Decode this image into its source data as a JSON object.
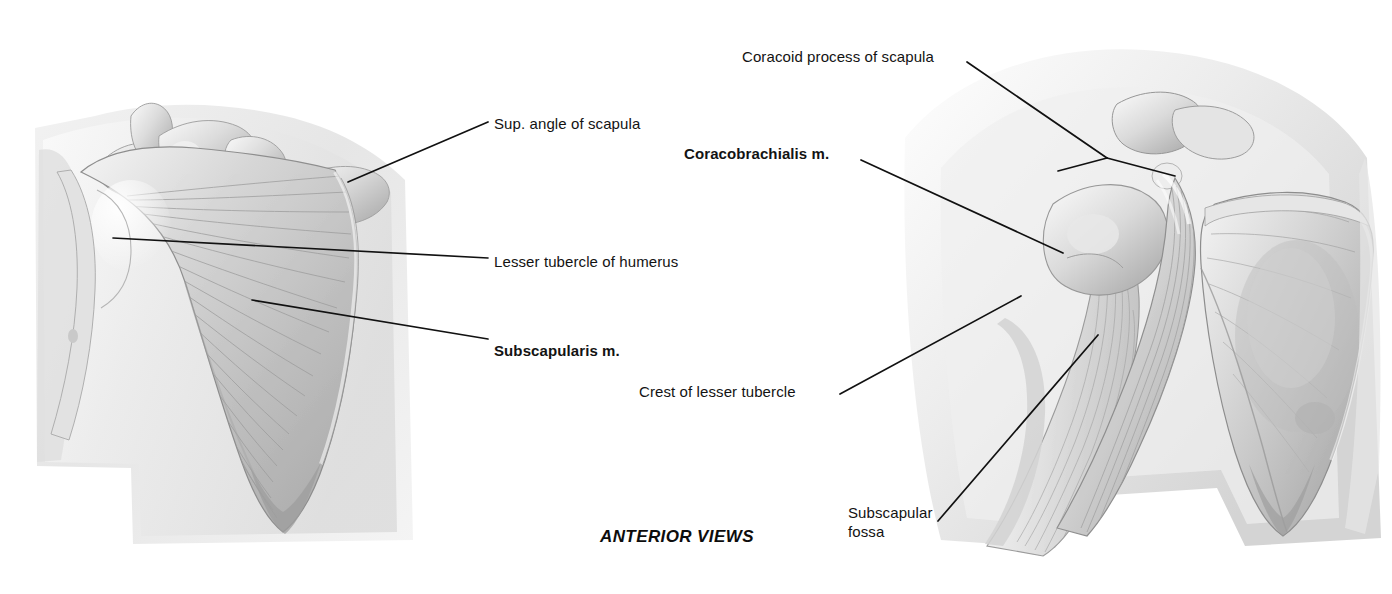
{
  "figure": {
    "caption": "ANTERIOR VIEWS",
    "background_color": "#ffffff",
    "ink_color": "#131313",
    "style": "grayscale pencil anatomical illustration"
  },
  "panels": [
    {
      "id": "left-panel",
      "name": "anterior-scapula-subscapularis",
      "description": "Anterior view of scapula with subscapularis muscle"
    },
    {
      "id": "right-panel",
      "name": "anterior-shoulder-coracobrachialis",
      "description": "Anterior view of shoulder with coracobrachialis muscle and scapula"
    }
  ],
  "labels": [
    {
      "id": "sup-angle-of-scapula",
      "text": "Sup. angle of scapula",
      "bold": false,
      "x": 494,
      "y": 114,
      "lines": [
        {
          "x1": 488,
          "y1": 122,
          "x2": 348,
          "y2": 182
        }
      ]
    },
    {
      "id": "lesser-tubercle-of-humerus",
      "text": "Lesser tubercle of humerus",
      "bold": false,
      "x": 494,
      "y": 252,
      "lines": [
        {
          "x1": 488,
          "y1": 258,
          "x2": 113,
          "y2": 238
        }
      ]
    },
    {
      "id": "subscapularis-m",
      "text": "Subscapularis m.",
      "bold": true,
      "x": 494,
      "y": 341,
      "lines": [
        {
          "x1": 488,
          "y1": 339,
          "x2": 252,
          "y2": 300
        }
      ]
    },
    {
      "id": "coracoid-process-of-scapula",
      "text": "Coracoid process of scapula",
      "bold": false,
      "x": 742,
      "y": 55,
      "lines": [
        {
          "x1": 967,
          "y1": 62,
          "x2": 1107,
          "y2": 158
        },
        {
          "x1": 1107,
          "y1": 158,
          "x2": 1060,
          "y2": 170
        },
        {
          "x1": 1107,
          "y1": 158,
          "x2": 1173,
          "y2": 175
        }
      ]
    },
    {
      "id": "coracobrachialis-m",
      "text": "Coracobrachialis m.",
      "bold": true,
      "x": 684,
      "y": 152,
      "lines": [
        {
          "x1": 861,
          "y1": 160,
          "x2": 1063,
          "y2": 253
        }
      ]
    },
    {
      "id": "crest-of-lesser-tubercle",
      "text": "Crest of lesser tubercle",
      "bold": false,
      "x": 639,
      "y": 390,
      "lines": [
        {
          "x1": 840,
          "y1": 394,
          "x2": 1021,
          "y2": 296
        }
      ]
    },
    {
      "id": "subscapular-fossa",
      "text": "Subscapular\nfossa",
      "bold": false,
      "x": 848,
      "y": 503,
      "lines": [
        {
          "x1": 938,
          "y1": 520,
          "x2": 1098,
          "y2": 335
        }
      ]
    }
  ],
  "caption_position": {
    "x": 600,
    "y": 527
  }
}
